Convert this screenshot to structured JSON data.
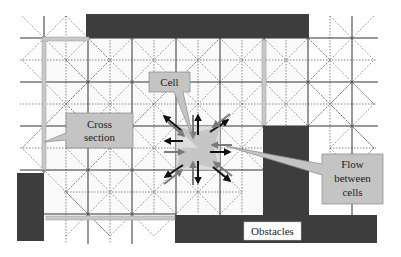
{
  "diagram": {
    "labels": {
      "cell": "Cell",
      "cross_section_line1": "Cross",
      "cross_section_line2": "section",
      "flow_line1": "Flow",
      "flow_line2": "between",
      "flow_line3": "cells",
      "obstacles": "Obstacles"
    },
    "colors": {
      "background": "#ffffff",
      "grid_solid": "#333333",
      "grid_dotted": "#555555",
      "obstacle": "#3d3d3d",
      "cross_section_bar": "#c8c8c8",
      "callout_fill": "#c4c4c4",
      "callout_stroke": "#888888",
      "cell_highlight": "#d6d6d6",
      "arrow_dark": "#111111",
      "arrow_gray": "#7a7a7a",
      "label_box": "#ffffff"
    },
    "grid": {
      "cell_size": 44,
      "solid_x": [
        44,
        88,
        132,
        176,
        220,
        264,
        308,
        352
      ],
      "solid_y": [
        38,
        82,
        126,
        170,
        214
      ],
      "dotted_x": [
        66,
        110,
        154,
        198,
        242,
        286,
        330
      ],
      "dotted_y": [
        60,
        104,
        148,
        192
      ]
    },
    "obstacles": [
      {
        "name": "top-obstacle",
        "x": 86,
        "y": 14,
        "w": 223,
        "h": 24
      },
      {
        "name": "right-obstacle",
        "x": 263,
        "y": 126,
        "w": 46,
        "h": 90
      },
      {
        "name": "bottom-obstacle",
        "x": 175,
        "y": 215,
        "w": 202,
        "h": 28
      },
      {
        "name": "left-obstacle",
        "x": 17,
        "y": 173,
        "w": 27,
        "h": 68
      }
    ],
    "cross_sections": [
      {
        "name": "left-vertical-section",
        "x": 42,
        "y": 38,
        "w": 4,
        "h": 132
      },
      {
        "name": "top-left-horizontal-section",
        "x": 42,
        "y": 37,
        "w": 47,
        "h": 4
      },
      {
        "name": "middle-vertical-section",
        "x": 262,
        "y": 40,
        "w": 4,
        "h": 85
      },
      {
        "name": "bottom-horizontal-section",
        "x": 46,
        "y": 216,
        "w": 129,
        "h": 4
      }
    ],
    "center_cell": {
      "cx": 198,
      "cy": 148
    }
  }
}
